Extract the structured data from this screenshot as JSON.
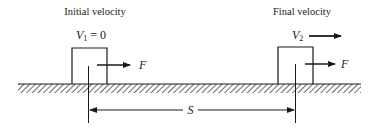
{
  "diagram": {
    "type": "physics-work-energy",
    "initial_state": {
      "caption": "Initial velocity",
      "velocity_symbol": "V",
      "velocity_subscript": "1",
      "velocity_value": "= 0",
      "force_label": "F"
    },
    "final_state": {
      "caption": "Final velocity",
      "velocity_symbol": "V",
      "velocity_subscript": "2",
      "force_label": "F"
    },
    "displacement": {
      "label": "S"
    },
    "colors": {
      "ink": "#1a1a1a",
      "background": "#ffffff"
    }
  }
}
